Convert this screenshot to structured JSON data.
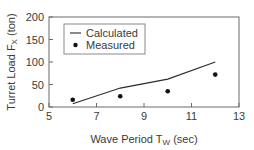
{
  "chart_data": {
    "type": "line",
    "title": "",
    "xlabel": "Wave Period T",
    "xlabel_subscript": "W",
    "xlabel_suffix": " (sec)",
    "ylabel": "Turret Load F",
    "ylabel_subscript": "X",
    "ylabel_suffix": " (ton)",
    "xlim": [
      5,
      13
    ],
    "ylim": [
      0,
      200
    ],
    "xticks": [
      5,
      7,
      9,
      11,
      13
    ],
    "yticks": [
      0,
      50,
      100,
      150,
      200
    ],
    "grid": false,
    "legend_position": "upper left",
    "series": [
      {
        "name": "Calculated",
        "style": "line",
        "color": "#2b2b2b",
        "x": [
          6,
          8,
          10,
          12
        ],
        "y": [
          7,
          42,
          62,
          100
        ]
      },
      {
        "name": "Measured",
        "style": "marker",
        "color": "#111111",
        "x": [
          6,
          8,
          10,
          12
        ],
        "y": [
          16,
          24,
          35,
          72
        ]
      }
    ]
  },
  "plot": {
    "left": 49,
    "right": 239,
    "top": 17,
    "bottom": 107,
    "axis_color": "#6a6a6a"
  },
  "legend": {
    "box": {
      "x": 64,
      "y": 24,
      "w": 81,
      "h": 30
    },
    "items": [
      "Calculated",
      "Measured"
    ]
  }
}
